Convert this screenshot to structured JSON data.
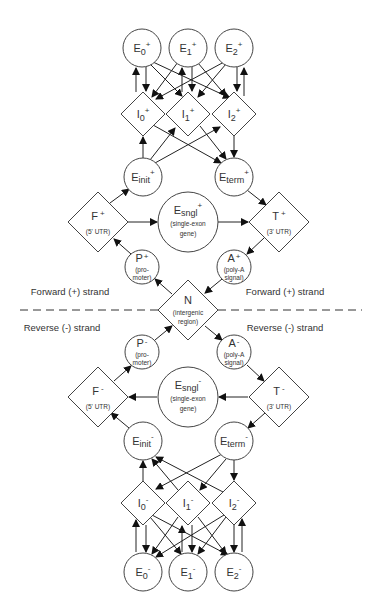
{
  "diagram": {
    "strand_labels": {
      "forward_left": "Forward (+) strand",
      "forward_right": "Forward (+) strand",
      "reverse_left": "Reverse (-) strand",
      "reverse_right": "Reverse (-) strand"
    },
    "nodes": {
      "E0p": {
        "base": "E",
        "sub": "0",
        "sup": "+"
      },
      "E1p": {
        "base": "E",
        "sub": "1",
        "sup": "+"
      },
      "E2p": {
        "base": "E",
        "sub": "2",
        "sup": "+"
      },
      "I0p": {
        "base": "I",
        "sub": "0",
        "sup": "+"
      },
      "I1p": {
        "base": "I",
        "sub": "1",
        "sup": "+"
      },
      "I2p": {
        "base": "I",
        "sub": "2",
        "sup": "+"
      },
      "Einitp": {
        "base": "E",
        "sub": "init",
        "sup": "+"
      },
      "Etermp": {
        "base": "E",
        "sub": "term",
        "sup": "+"
      },
      "Fp": {
        "base": "F",
        "sup": "+",
        "desc1": "(5' UTR)"
      },
      "Esnglp": {
        "base": "E",
        "sub": "sngl",
        "sup": "+",
        "desc1": "(single-exon",
        "desc2": "gene)"
      },
      "Tp": {
        "base": "T",
        "sup": "+",
        "desc1": "(3' UTR)"
      },
      "Pp": {
        "base": "P",
        "sup": "+",
        "desc1": "(pro-",
        "desc2": "moter)"
      },
      "Ap": {
        "base": "A",
        "sup": "+",
        "desc1": "(poly-A",
        "desc2": "signal)"
      },
      "N": {
        "base": "N",
        "desc1": "(intergenic",
        "desc2": "region)"
      },
      "Pm": {
        "base": "P",
        "sup": "-",
        "desc1": "(pro-",
        "desc2": "moter)"
      },
      "Am": {
        "base": "A",
        "sup": "-",
        "desc1": "(poly-A",
        "desc2": "signal)"
      },
      "Fm": {
        "base": "F",
        "sup": "-",
        "desc1": "(5' UTR)"
      },
      "Esnglm": {
        "base": "E",
        "sub": "sngl",
        "sup": "-",
        "desc1": "(single-exon",
        "desc2": "gene)"
      },
      "Tm": {
        "base": "T",
        "sup": "-",
        "desc1": "(3' UTR)"
      },
      "Einitm": {
        "base": "E",
        "sub": "init",
        "sup": "-"
      },
      "Etermm": {
        "base": "E",
        "sub": "term",
        "sup": "-"
      },
      "I0m": {
        "base": "I",
        "sub": "0",
        "sup": "-"
      },
      "I1m": {
        "base": "I",
        "sub": "1",
        "sup": "-"
      },
      "I2m": {
        "base": "I",
        "sub": "2",
        "sup": "-"
      },
      "E0m": {
        "base": "E",
        "sub": "0",
        "sup": "-"
      },
      "E1m": {
        "base": "E",
        "sub": "1",
        "sup": "-"
      },
      "E2m": {
        "base": "E",
        "sub": "2",
        "sup": "-"
      }
    },
    "colors": {
      "line": "#222222",
      "shape_stroke": "#444444",
      "text": "#333333",
      "background": "#ffffff"
    }
  }
}
